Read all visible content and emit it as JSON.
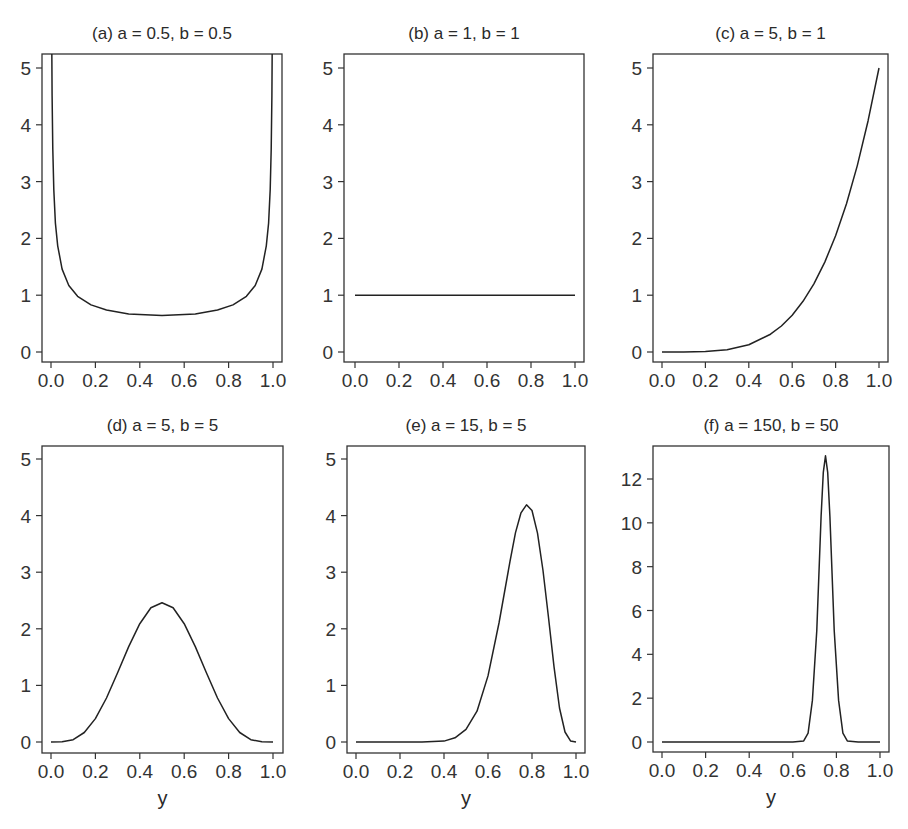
{
  "figure": {
    "panels": [
      {
        "id": "a",
        "title": "(a) a = 0.5, b = 0.5",
        "box": [
          42,
          54,
          282,
          362
        ],
        "xpx": [
          51,
          273
        ],
        "ypx": [
          352,
          68
        ],
        "ymax": 5,
        "yticks": [
          0,
          1,
          2,
          3,
          4,
          5
        ],
        "xlabel": ""
      },
      {
        "id": "b",
        "title": "(b) a = 1, b = 1",
        "box": [
          344,
          54,
          584,
          362
        ],
        "xpx": [
          355,
          575
        ],
        "ypx": [
          352,
          68
        ],
        "ymax": 5,
        "yticks": [
          0,
          1,
          2,
          3,
          4,
          5
        ],
        "xlabel": ""
      },
      {
        "id": "c",
        "title": "(c) a = 5, b = 1",
        "box": [
          653,
          54,
          888,
          362
        ],
        "xpx": [
          662,
          879
        ],
        "ypx": [
          352,
          68
        ],
        "ymax": 5,
        "yticks": [
          0,
          1,
          2,
          3,
          4,
          5
        ],
        "xlabel": ""
      },
      {
        "id": "d",
        "title": "(d) a = 5, b = 5",
        "box": [
          42,
          446,
          283,
          753
        ],
        "xpx": [
          51,
          273
        ],
        "ypx": [
          742,
          459
        ],
        "ymax": 5,
        "yticks": [
          0,
          1,
          2,
          3,
          4,
          5
        ],
        "xlabel": "y"
      },
      {
        "id": "e",
        "title": "(e) a = 15, b = 5",
        "box": [
          347,
          446,
          585,
          753
        ],
        "xpx": [
          356,
          576
        ],
        "ypx": [
          742,
          459
        ],
        "ymax": 5,
        "yticks": [
          0,
          1,
          2,
          3,
          4,
          5
        ],
        "xlabel": "y"
      },
      {
        "id": "f",
        "title": "(f) a = 150, b = 50",
        "box": [
          653,
          446,
          889,
          752
        ],
        "xpx": [
          662,
          880
        ],
        "ypx": [
          742,
          479
        ],
        "ymax": 12,
        "yticks": [
          0,
          2,
          4,
          6,
          8,
          10,
          12
        ],
        "xlabel": "y"
      }
    ],
    "xticks": [
      "0.0",
      "0.2",
      "0.4",
      "0.6",
      "0.8",
      "1.0"
    ]
  },
  "chart_data": [
    {
      "type": "line",
      "title": "(a) a = 0.5, b = 0.5",
      "xlabel": "",
      "ylabel": "",
      "xlim": [
        0,
        1
      ],
      "ylim": [
        0,
        5
      ],
      "grid": false,
      "x": [
        0.0032,
        0.005,
        0.008,
        0.0125,
        0.02,
        0.03,
        0.05,
        0.08,
        0.12,
        0.18,
        0.25,
        0.35,
        0.5,
        0.65,
        0.75,
        0.82,
        0.88,
        0.92,
        0.95,
        0.97,
        0.98,
        0.9875,
        0.992,
        0.995,
        0.9968
      ],
      "y": [
        5.64,
        4.51,
        3.57,
        2.86,
        2.27,
        1.87,
        1.46,
        1.17,
        0.98,
        0.83,
        0.74,
        0.67,
        0.64,
        0.67,
        0.74,
        0.83,
        0.98,
        1.17,
        1.46,
        1.87,
        2.27,
        2.86,
        3.57,
        4.51,
        5.64
      ]
    },
    {
      "type": "line",
      "title": "(b) a = 1, b = 1",
      "xlabel": "",
      "ylabel": "",
      "xlim": [
        0,
        1
      ],
      "ylim": [
        0,
        5
      ],
      "grid": false,
      "x": [
        0,
        1
      ],
      "y": [
        1,
        1
      ]
    },
    {
      "type": "line",
      "title": "(c) a = 5, b = 1",
      "xlabel": "",
      "ylabel": "",
      "xlim": [
        0,
        1
      ],
      "ylim": [
        0,
        5
      ],
      "grid": false,
      "x": [
        0,
        0.1,
        0.2,
        0.3,
        0.4,
        0.5,
        0.55,
        0.6,
        0.65,
        0.7,
        0.75,
        0.8,
        0.85,
        0.9,
        0.95,
        1.0
      ],
      "y": [
        0,
        0.0005,
        0.008,
        0.041,
        0.128,
        0.313,
        0.458,
        0.648,
        0.893,
        1.2,
        1.582,
        2.048,
        2.61,
        3.281,
        4.073,
        5.0
      ]
    },
    {
      "type": "line",
      "title": "(d) a = 5, b = 5",
      "xlabel": "y",
      "ylabel": "",
      "xlim": [
        0,
        1
      ],
      "ylim": [
        0,
        5
      ],
      "grid": false,
      "x": [
        0,
        0.05,
        0.1,
        0.15,
        0.2,
        0.25,
        0.3,
        0.35,
        0.4,
        0.45,
        0.5,
        0.55,
        0.6,
        0.65,
        0.7,
        0.75,
        0.8,
        0.85,
        0.9,
        0.95,
        1.0
      ],
      "y": [
        0,
        0.003,
        0.041,
        0.167,
        0.413,
        0.778,
        1.225,
        1.686,
        2.09,
        2.372,
        2.461,
        2.372,
        2.09,
        1.686,
        1.225,
        0.778,
        0.413,
        0.167,
        0.041,
        0.003,
        0
      ]
    },
    {
      "type": "line",
      "title": "(e) a = 15, b = 5",
      "xlabel": "y",
      "ylabel": "",
      "xlim": [
        0,
        1
      ],
      "ylim": [
        0,
        5
      ],
      "grid": false,
      "x": [
        0,
        0.3,
        0.4,
        0.45,
        0.5,
        0.55,
        0.6,
        0.65,
        0.7,
        0.725,
        0.75,
        0.775,
        0.8,
        0.825,
        0.85,
        0.875,
        0.9,
        0.925,
        0.95,
        0.975,
        1.0
      ],
      "y": [
        0,
        0.0003,
        0.016,
        0.074,
        0.222,
        0.545,
        1.167,
        2.102,
        3.19,
        3.7,
        4.05,
        4.19,
        4.09,
        3.69,
        3.03,
        2.2,
        1.33,
        0.6,
        0.177,
        0.02,
        0
      ]
    },
    {
      "type": "line",
      "title": "(f) a = 150, b = 50",
      "xlabel": "y",
      "ylabel": "",
      "xlim": [
        0,
        1
      ],
      "ylim": [
        0,
        13.5
      ],
      "grid": false,
      "x": [
        0,
        0.6,
        0.65,
        0.67,
        0.69,
        0.71,
        0.73,
        0.74,
        0.75,
        0.76,
        0.77,
        0.79,
        0.81,
        0.83,
        0.85,
        0.9,
        1.0
      ],
      "y": [
        0,
        0,
        0.05,
        0.4,
        1.9,
        5.1,
        10.3,
        12.3,
        13.06,
        12.3,
        10.3,
        5.1,
        1.9,
        0.4,
        0.05,
        0,
        0
      ]
    }
  ]
}
